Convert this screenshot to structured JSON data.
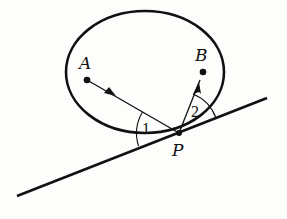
{
  "diagram": {
    "type": "geometry",
    "points": {
      "A": {
        "label": "A",
        "x": 87,
        "y": 80
      },
      "B": {
        "label": "B",
        "x": 203,
        "y": 72
      },
      "P": {
        "label": "P",
        "x": 179,
        "y": 133
      }
    },
    "angles": [
      {
        "label": "1",
        "between": "incoming ray AP and tangent line"
      },
      {
        "label": "2",
        "between": "outgoing ray PB and tangent line"
      }
    ],
    "ellipse": {
      "cx": 145,
      "cy": 72,
      "rx": 79,
      "ry": 61
    },
    "tangent_line": {
      "x1": 17,
      "y1": 196,
      "x2": 267,
      "y2": 98
    },
    "colors": {
      "stroke": "#111111",
      "background": "#fdfdfb"
    }
  }
}
